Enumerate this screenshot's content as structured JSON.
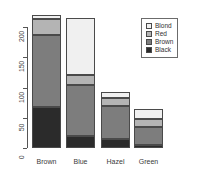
{
  "chart_data": {
    "type": "bar",
    "stacked": true,
    "title": "",
    "subtitle": "",
    "xlabel": "",
    "ylabel": "",
    "categories": [
      "Brown",
      "Blue",
      "Hazel",
      "Green"
    ],
    "series": [
      {
        "name": "Black",
        "color": "#2b2b2b",
        "values": [
          68,
          20,
          15,
          5
        ]
      },
      {
        "name": "Brown",
        "color": "#7d7d7d",
        "values": [
          119,
          84,
          54,
          29
        ]
      },
      {
        "name": "Red",
        "color": "#b4b4b4",
        "values": [
          26,
          17,
          14,
          14
        ]
      },
      {
        "name": "Blond",
        "color": "#f0f0f0",
        "values": [
          7,
          94,
          10,
          16
        ]
      }
    ],
    "stack_order_bottom_to_top": [
      "Black",
      "Brown",
      "Red",
      "Blond"
    ],
    "legend_order_top_to_bottom": [
      "Blond",
      "Red",
      "Brown",
      "Black"
    ],
    "legend_position": "top-right",
    "totals": [
      220,
      215,
      93,
      64
    ],
    "ylim": [
      0,
      220
    ],
    "yticks": [
      0,
      50,
      100,
      150,
      200
    ],
    "ytick_labels": [
      "0",
      "50",
      "100",
      "150",
      "200"
    ],
    "grid": false,
    "axis_color": "#555555"
  },
  "legend": {
    "entries": [
      {
        "label": "Blond",
        "color": "#f0f0f0"
      },
      {
        "label": "Red",
        "color": "#b4b4b4"
      },
      {
        "label": "Brown",
        "color": "#7d7d7d"
      },
      {
        "label": "Black",
        "color": "#2b2b2b"
      }
    ]
  },
  "axes": {
    "y_tick_labels": [
      "0",
      "50",
      "100",
      "150",
      "200"
    ],
    "x_tick_labels": [
      "Brown",
      "Blue",
      "Hazel",
      "Green"
    ]
  }
}
